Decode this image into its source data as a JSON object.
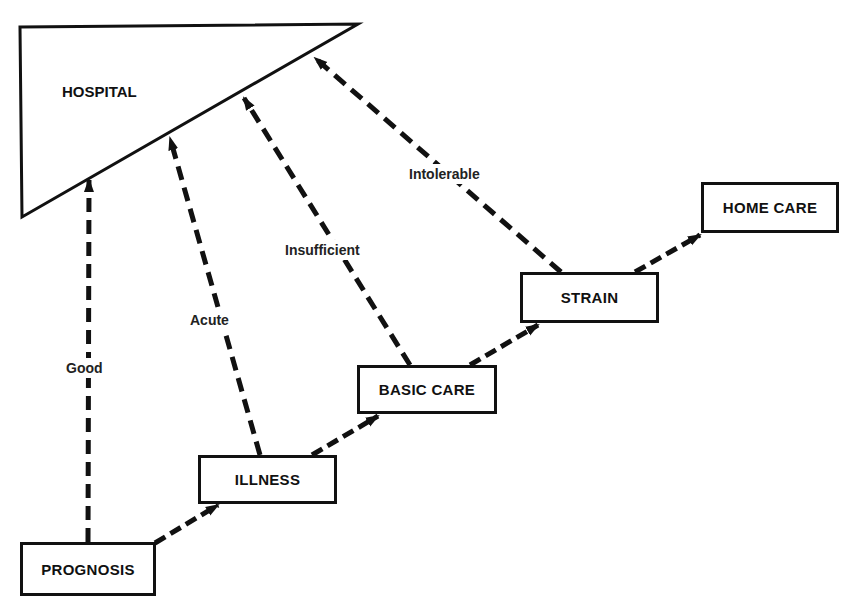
{
  "diagram": {
    "hospital": {
      "label": "HOSPITAL"
    },
    "nodes": [
      {
        "id": "prognosis",
        "label": "PROGNOSIS"
      },
      {
        "id": "illness",
        "label": "ILLNESS"
      },
      {
        "id": "basic_care",
        "label": "BASIC CARE"
      },
      {
        "id": "strain",
        "label": "STRAIN"
      },
      {
        "id": "home_care",
        "label": "HOME CARE"
      }
    ],
    "edges_to_hospital": [
      {
        "from": "prognosis",
        "label": "Good"
      },
      {
        "from": "illness",
        "label": "Acute"
      },
      {
        "from": "basic_care",
        "label": "Insufficient"
      },
      {
        "from": "strain",
        "label": "Intolerable"
      }
    ],
    "chain_edges": [
      {
        "from": "prognosis",
        "to": "illness"
      },
      {
        "from": "illness",
        "to": "basic_care"
      },
      {
        "from": "basic_care",
        "to": "strain"
      },
      {
        "from": "strain",
        "to": "home_care"
      }
    ]
  }
}
